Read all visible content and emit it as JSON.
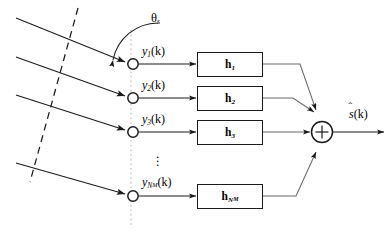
{
  "figure": {
    "angle_label": "θ",
    "angle_sub": "s",
    "ellipsis": "⋮",
    "sum_symbol": "+",
    "output": {
      "base": "s",
      "hat": "ˆ",
      "arg": "(k)"
    },
    "colors": {
      "line": "#1a1a1a",
      "thin_line": "#6a6a6a",
      "dotted_axis": "#bdbdbd",
      "dashed_wavefront": "#1a1a1a",
      "background": "#ffffff"
    },
    "sensors": [
      {
        "name": "sensor-1",
        "signal": "y",
        "sub": "1",
        "arg": "(k)",
        "filter": "h",
        "filter_sub": "1",
        "y": 64
      },
      {
        "name": "sensor-2",
        "signal": "y",
        "sub": "2",
        "arg": "(k)",
        "filter": "h",
        "filter_sub": "2",
        "y": 98
      },
      {
        "name": "sensor-3",
        "signal": "y",
        "sub": "3",
        "arg": "(k)",
        "filter": "h",
        "filter_sub": "3",
        "y": 132
      },
      {
        "name": "sensor-nm",
        "signal": "y",
        "sub": "N",
        "sub_sub": "M",
        "arg": "(k)",
        "filter": "h",
        "filter_sub": "N",
        "filter_sub_sub": "M",
        "y": 196
      }
    ],
    "wavefront": {
      "style": "dashed",
      "description": "plane wavefront"
    },
    "array_axis": {
      "style": "dotted",
      "description": "sensor array axis"
    },
    "incoming_waves": 4
  }
}
